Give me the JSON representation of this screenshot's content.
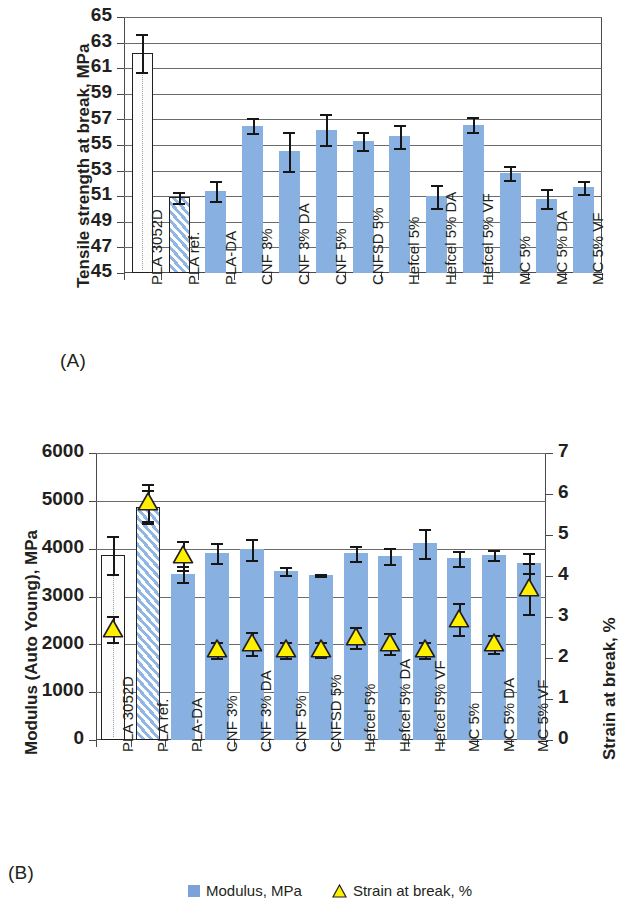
{
  "panels": {
    "a_letter": "(A)",
    "b_letter": "(B)"
  },
  "legend": {
    "modulus": "Modulus, MPa",
    "strain": "Strain at break, %"
  },
  "colors": {
    "bar_blue": "#88b0e0",
    "triangle_yellow": "#fff000",
    "outline": "#231f20",
    "grid": "#6b6b6b"
  },
  "chart_data": [
    {
      "type": "bar",
      "id": "A",
      "title": "",
      "ylabel": "Tensile strength at break, MPa",
      "xlabel": "",
      "ylim": [
        45,
        65
      ],
      "ytick_step": 2,
      "yticks": [
        45,
        47,
        49,
        51,
        53,
        55,
        57,
        59,
        61,
        63,
        65
      ],
      "grid": true,
      "legend_position": "none",
      "categories": [
        "PLA 3052D",
        "PLA ref.",
        "PLA-DA",
        "CNF 3%",
        "CNF 3% DA",
        "CNF 5%",
        "CNFSD 5%",
        "Hefcel 5%",
        "Hefcel 5% DA",
        "Hefcel 5% VF",
        "MC 5%",
        "MC 5% DA",
        "MC 5% VF"
      ],
      "series": [
        {
          "name": "Tensile strength at break, MPa",
          "values": [
            62.2,
            50.9,
            51.4,
            56.5,
            54.5,
            56.2,
            55.3,
            55.7,
            51.0,
            56.6,
            52.8,
            50.8,
            51.7
          ],
          "errors": [
            1.5,
            0.45,
            0.8,
            0.6,
            1.5,
            1.2,
            0.7,
            0.9,
            0.9,
            0.6,
            0.55,
            0.75,
            0.5
          ],
          "styles": [
            "open",
            "hatch",
            "solid",
            "solid",
            "solid",
            "solid",
            "solid",
            "solid",
            "solid",
            "solid",
            "solid",
            "solid",
            "solid"
          ]
        }
      ]
    },
    {
      "type": "bar",
      "id": "B",
      "title": "",
      "ylabel": "Modulus (Auto Young), MPa",
      "ylabel_secondary": "Strain at break, %",
      "xlabel": "",
      "ylim": [
        0,
        6000
      ],
      "ytick_step": 1000,
      "yticks": [
        0,
        1000,
        2000,
        3000,
        4000,
        5000,
        6000
      ],
      "ylim_secondary": [
        0,
        7
      ],
      "ytick_step_secondary": 1,
      "yticks_secondary": [
        0,
        1,
        2,
        3,
        4,
        5,
        6,
        7
      ],
      "grid": true,
      "legend_position": "bottom",
      "categories": [
        "PLA 3052D",
        "PLA ref.",
        "PLA-DA",
        "CNF 3%",
        "CNF 3% DA",
        "CNF 5%",
        "CNFSD 5%",
        "Hefcel 5%",
        "Hefcel 5% DA",
        "Hefcel 5% VF",
        "MC 5%",
        "MC 5% DA",
        "MC 5% VF"
      ],
      "series": [
        {
          "name": "Modulus, MPa",
          "axis": "left",
          "values": [
            3870,
            4880,
            3470,
            3900,
            3990,
            3530,
            3450,
            3900,
            3850,
            4110,
            3800,
            3870,
            3700
          ],
          "errors": [
            400,
            340,
            160,
            210,
            220,
            90,
            30,
            160,
            170,
            300,
            160,
            100,
            200
          ],
          "styles": [
            "open",
            "hatch",
            "solid",
            "solid",
            "solid",
            "solid",
            "solid",
            "solid",
            "solid",
            "solid",
            "solid",
            "solid",
            "solid"
          ]
        },
        {
          "name": "Strain at break, %",
          "axis": "right",
          "marker": "triangle",
          "values": [
            2.7,
            5.8,
            4.5,
            2.2,
            2.35,
            2.2,
            2.2,
            2.5,
            2.35,
            2.2,
            2.95,
            2.35,
            3.7
          ],
          "errors": [
            0.32,
            0.45,
            0.35,
            0.2,
            0.28,
            0.2,
            0.18,
            0.26,
            0.25,
            0.2,
            0.4,
            0.22,
            0.62
          ]
        }
      ]
    }
  ]
}
